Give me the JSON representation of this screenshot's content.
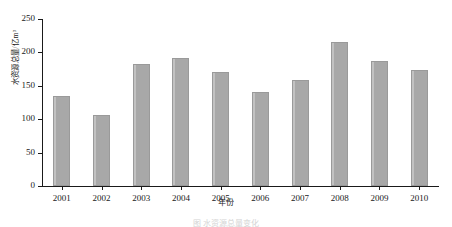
{
  "chart_data": {
    "type": "bar",
    "title": "",
    "xlabel": "年份",
    "ylabel": "水资源总量/亿m³",
    "categories": [
      "2001",
      "2002",
      "2003",
      "2004",
      "2005",
      "2006",
      "2007",
      "2008",
      "2009",
      "2010"
    ],
    "values": [
      135,
      107,
      183,
      192,
      171,
      141,
      158,
      216,
      187,
      174
    ],
    "ylim": [
      0,
      250
    ],
    "yticks": [
      0,
      50,
      100,
      150,
      200,
      250
    ],
    "ytick_labels": [
      "0",
      "50",
      "100",
      "150",
      "200",
      "250"
    ],
    "grid": false,
    "legend": false,
    "legend_position": "none",
    "series": [
      {
        "name": "水资源总量",
        "values": [
          135,
          107,
          183,
          192,
          171,
          141,
          158,
          216,
          187,
          174
        ]
      }
    ]
  },
  "style": {
    "bar_fill": "#a8a8a8",
    "bar_edge": "#9a9a9a",
    "bar_highlight": "#c2c2c2",
    "axis_color": "#1a1a1a",
    "text_color": "#1a1a1a",
    "background": "#ffffff"
  },
  "caption": {
    "text": "图 水资源总量变化"
  }
}
